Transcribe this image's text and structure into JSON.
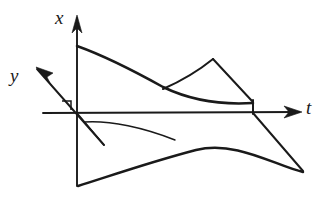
{
  "figure": {
    "background_color": "#ffffff",
    "ink_color": "#1a1a1a",
    "width": 329,
    "height": 202
  },
  "axes": {
    "vertical": {
      "name": "x-axis",
      "label": "x",
      "label_position": {
        "x": 55,
        "y": 8
      },
      "origin": {
        "x": 77,
        "y": 113
      },
      "arrow_tip": {
        "x": 77,
        "y": 18
      },
      "bottom_end": {
        "x": 77,
        "y": 186
      },
      "direction": "up"
    },
    "oblique": {
      "name": "y-axis",
      "label": "y",
      "label_position": {
        "x": 10,
        "y": 66
      },
      "origin": {
        "x": 77,
        "y": 113
      },
      "arrow_tip": {
        "x": 37,
        "y": 69
      },
      "back_end": {
        "x": 104,
        "y": 145
      },
      "direction": "up-left"
    },
    "horizontal": {
      "name": "t-axis",
      "label": "t",
      "label_position": {
        "x": 306,
        "y": 98
      },
      "origin": {
        "x": 77,
        "y": 113
      },
      "left_end": {
        "x": 43,
        "y": 113
      },
      "arrow_tip": {
        "x": 299,
        "y": 112
      },
      "direction": "right"
    },
    "right_angle_marker": {
      "name": "right-angle-marker",
      "path": "M 62 101 L 71 101 L 71 110"
    }
  },
  "curves": [
    {
      "name": "upper-main-curve",
      "description": "descending concave curve from x-axis down toward the right, flattening near the t-axis",
      "weight": "thick",
      "path": "M 77 46 C 105 56 136 72 163 87 C 190 100 222 105 253 103"
    },
    {
      "name": "upper-branch-rising",
      "description": "branch leaving the main curve, rising to a peak then falling steeply",
      "weight": "med",
      "path": "M 163 89 C 179 82 197 72 213 59"
    },
    {
      "name": "upper-branch-falling",
      "description": "steep straight fall from the peak down to the vertical drop at the t-axis",
      "weight": "med",
      "path": "M 213 59 L 252 101"
    },
    {
      "name": "vertical-drop-segment",
      "description": "short vertical segment connecting the upper curve down to the t-axis",
      "weight": "med",
      "path": "M 253 100 L 253 114"
    },
    {
      "name": "right-descending-ray",
      "description": "straight ray from the drop point descending to the right-hand cusp",
      "weight": "med",
      "path": "M 253 113 L 303 171"
    },
    {
      "name": "lower-outer-curve",
      "description": "lower convex curve from the bottom of the x-axis sweeping right to the cusp",
      "weight": "thick",
      "path": "M 78 186 C 110 176 150 162 196 150 C 236 140 276 166 303 172"
    },
    {
      "name": "lower-inner-curve",
      "description": "thin curve starting just under the origin and meeting the lower outer curve",
      "weight": "thin",
      "path": "M 84 122 C 110 120 145 128 175 140"
    },
    {
      "name": "y-axis-extension-below",
      "description": "continuation of the oblique y-axis below the origin toward lower right",
      "weight": "thin",
      "path": "M 77 113 L 104 145"
    }
  ],
  "arrow_heads": [
    {
      "name": "x-axis-arrowhead",
      "points": "77,15 72,33 77,28 82,33"
    },
    {
      "name": "y-axis-arrowhead",
      "points": "36,67 53,73 47,77 51,85"
    },
    {
      "name": "t-axis-arrowhead",
      "points": "302,112 284,106 289,112 284,118"
    }
  ]
}
